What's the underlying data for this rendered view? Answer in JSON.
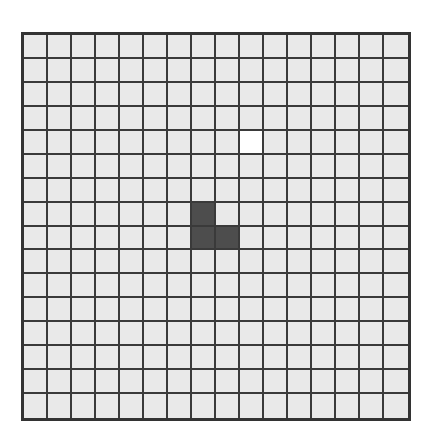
{
  "board": {
    "rows": 16,
    "cols": 16,
    "colors": {
      "empty": "#e9e9e9",
      "white": "#ffffff",
      "dark": "#4d4d4d",
      "grid_line": "#3a3a3a",
      "border": "#333333"
    },
    "special_cells": [
      {
        "row": 4,
        "col": 9,
        "state": "white"
      },
      {
        "row": 7,
        "col": 7,
        "state": "dark"
      },
      {
        "row": 8,
        "col": 7,
        "state": "dark"
      },
      {
        "row": 8,
        "col": 8,
        "state": "dark"
      }
    ]
  }
}
